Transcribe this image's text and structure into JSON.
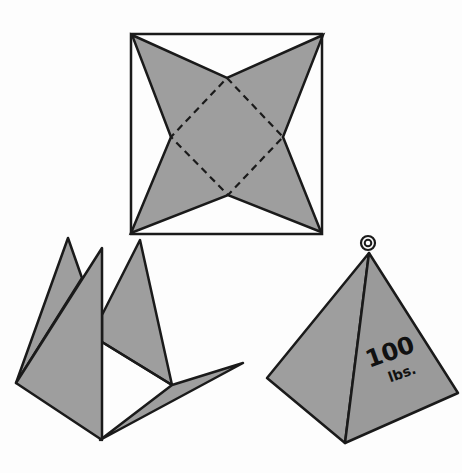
{
  "figure": {
    "colors": {
      "background": "#fdfdfd",
      "fill": "#9e9e9e",
      "stroke": "#1a1a1a"
    },
    "pattern": {
      "label": "flat pattern: square with four-pointed star, dashed fold square"
    },
    "folding_step": {
      "label": "partially folded pattern"
    },
    "finished_pyramid": {
      "weight_number": "100",
      "weight_unit": "lbs.",
      "ring": "hanging ring"
    }
  }
}
